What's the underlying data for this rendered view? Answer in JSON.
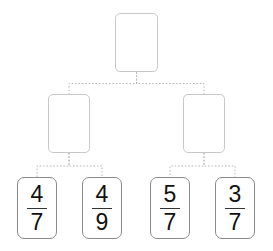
{
  "diagram": {
    "type": "binary-tree",
    "title": "",
    "canvas": {
      "width": 273,
      "height": 251,
      "background": "#ffffff"
    },
    "style": {
      "internal_node_border_color": "#c9c9c9",
      "leaf_card_border_color": "#8a8a8a",
      "connector_color": "#b8b8b8",
      "connector_style": "dotted",
      "text_color": "#111111"
    },
    "levels": [
      {
        "level": 0,
        "name": "root",
        "nodes": [
          {
            "id": "root",
            "label": "",
            "empty": true,
            "x": 115,
            "y": 13,
            "w": 43,
            "h": 59
          }
        ]
      },
      {
        "level": 1,
        "name": "branch",
        "nodes": [
          {
            "id": "branch-left",
            "label": "",
            "empty": true,
            "x": 48,
            "y": 94,
            "w": 42,
            "h": 59
          },
          {
            "id": "branch-right",
            "label": "",
            "empty": true,
            "x": 183,
            "y": 94,
            "w": 42,
            "h": 59
          }
        ]
      },
      {
        "level": 2,
        "name": "leaves",
        "nodes": [
          {
            "id": "leaf-1",
            "numerator": "4",
            "denominator": "7",
            "x": 17,
            "y": 177,
            "w": 40,
            "h": 62
          },
          {
            "id": "leaf-2",
            "numerator": "4",
            "denominator": "9",
            "x": 82,
            "y": 177,
            "w": 40,
            "h": 62
          },
          {
            "id": "leaf-3",
            "numerator": "5",
            "denominator": "7",
            "x": 150,
            "y": 177,
            "w": 40,
            "h": 62
          },
          {
            "id": "leaf-4",
            "numerator": "3",
            "denominator": "7",
            "x": 215,
            "y": 177,
            "w": 40,
            "h": 62
          }
        ]
      }
    ],
    "edges": [
      {
        "from": "root",
        "to": "branch-left"
      },
      {
        "from": "root",
        "to": "branch-right"
      },
      {
        "from": "branch-left",
        "to": "leaf-1"
      },
      {
        "from": "branch-left",
        "to": "leaf-2"
      },
      {
        "from": "branch-right",
        "to": "leaf-3"
      },
      {
        "from": "branch-right",
        "to": "leaf-4"
      }
    ]
  }
}
